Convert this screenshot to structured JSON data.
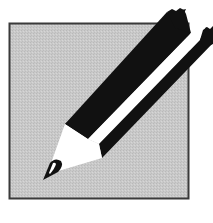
{
  "icon": {
    "name": "pencil-edit-icon",
    "colors": {
      "background": "#ffffff",
      "square_fill": "#c8c8c8",
      "square_border": "#3a3a3a",
      "pencil_dark": "#111111",
      "pencil_light": "#ffffff"
    }
  }
}
